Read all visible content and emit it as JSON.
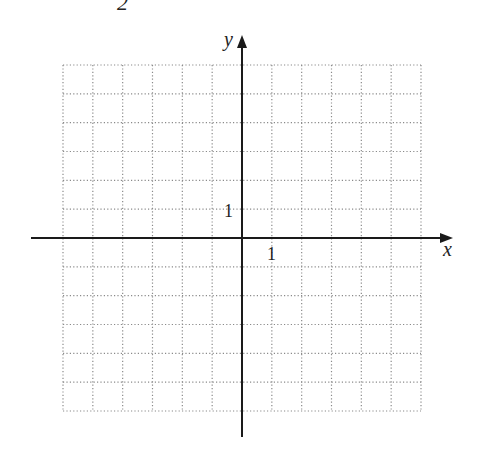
{
  "header": {
    "partial_text": "2"
  },
  "chart_data": {
    "type": "scatter",
    "title": "",
    "xlabel": "x",
    "ylabel": "y",
    "xlim": [
      -6,
      6
    ],
    "ylim": [
      -6,
      6
    ],
    "grid": true,
    "grid_style": "dotted",
    "tick_labels": {
      "x": [
        "1"
      ],
      "y": [
        "1"
      ]
    },
    "series": [],
    "legend": null
  },
  "axes": {
    "x_label": "x",
    "y_label": "y",
    "x_tick": "1",
    "y_tick": "1"
  },
  "colors": {
    "axis": "#1a1a1a",
    "grid": "#8a8a8a",
    "background": "#ffffff"
  }
}
